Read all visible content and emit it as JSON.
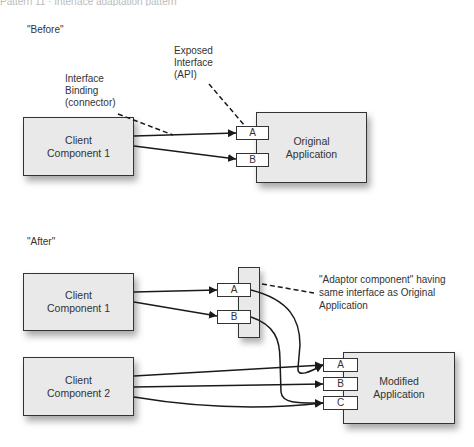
{
  "caption_fragment": "Pattern 11 · Interface adaptation pattern",
  "before": {
    "title": "\"Before\"",
    "annotations": {
      "interface_binding": "Interface\nBinding\n(connector)",
      "exposed_interface": "Exposed\nInterface\n(API)"
    },
    "client1": "Client\nComponent 1",
    "application": "Original\nApplication",
    "ports": [
      "A",
      "B"
    ]
  },
  "after": {
    "title": "\"After\"",
    "client1": "Client\nComponent 1",
    "client2": "Client\nComponent 2",
    "adaptor_ports": [
      "A",
      "B"
    ],
    "adaptor_annotation": "\"Adaptor component\" having\nsame interface as Original\nApplication",
    "application": "Modified\nApplication",
    "ports": [
      "A",
      "B",
      "C"
    ]
  }
}
